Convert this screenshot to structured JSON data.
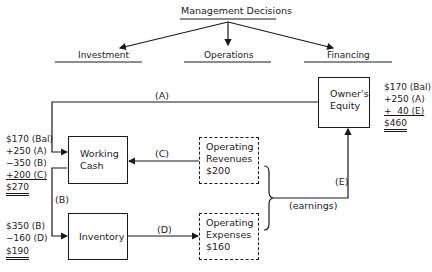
{
  "title": "Management Decisions",
  "categories": [
    "Investment",
    "Operations",
    "Financing"
  ],
  "boxes": {
    "owners_equity": [
      "Owner's",
      "Equity"
    ],
    "working_cash": [
      "Working",
      "Cash"
    ],
    "inventory": "Inventory",
    "operating_revenues": [
      "Operating",
      "Revenues",
      "$200"
    ],
    "operating_expenses": [
      "Operating",
      "Expenses",
      "$160"
    ]
  },
  "flows": {
    "a": "(A)",
    "b": "(B)",
    "c": "(C)",
    "d": "(D)",
    "e": "(E)",
    "earnings": "(earnings)"
  },
  "ledgers": {
    "cash": [
      "$170 (Bal)",
      "+250 (A)",
      "−350 (B)",
      "+200 (C)",
      "$270"
    ],
    "inventory": [
      "$350 (B)",
      "−160 (D)",
      "$190"
    ],
    "equity": [
      "$170 (Bal)",
      "+250 (A)",
      "+  40 (E)",
      "$460"
    ]
  }
}
